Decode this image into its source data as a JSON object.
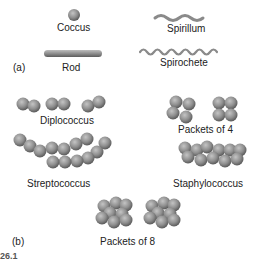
{
  "figure": {
    "panel_a": {
      "label": "(a)",
      "shapes": [
        {
          "name": "Coccus"
        },
        {
          "name": "Rod"
        },
        {
          "name": "Spirillum"
        },
        {
          "name": "Spirochete"
        }
      ]
    },
    "panel_b": {
      "label": "(b)",
      "arrangements": [
        {
          "name": "Diplococcus"
        },
        {
          "name": "Packets of 4"
        },
        {
          "name": "Streptococcus"
        },
        {
          "name": "Staphylococcus"
        },
        {
          "name": "Packets of 8"
        }
      ]
    },
    "caption_fragment": "26.1"
  },
  "colors": {
    "cell_light": "#b8b8b8",
    "cell_mid": "#8c8c8c",
    "cell_dark": "#555555",
    "text": "#222222"
  }
}
